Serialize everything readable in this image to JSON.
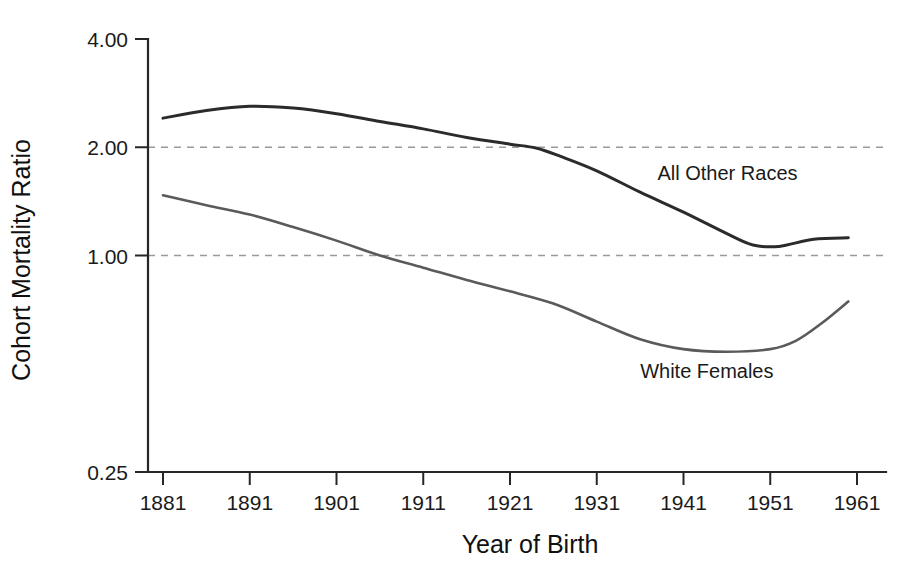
{
  "chart_data": {
    "type": "line",
    "title": "",
    "xlabel": "Year of Birth",
    "ylabel": "Cohort Mortality Ratio",
    "yscale": "log2",
    "ylim": [
      0.25,
      4.0
    ],
    "xlim": [
      1876,
      1962
    ],
    "grid": "horizontal-dashed-at-1-and-2",
    "legend_position": "inline-annotations",
    "ytick_labels": [
      "4.00",
      "2.00",
      "1.00",
      "0.25"
    ],
    "ytick_values": [
      4.0,
      2.0,
      1.0,
      0.25
    ],
    "gridline_values": [
      2.0,
      1.0
    ],
    "xtick_labels": [
      "1881",
      "1891",
      "1901",
      "1911",
      "1921",
      "1931",
      "1941",
      "1951",
      "1961"
    ],
    "xtick_values": [
      1881,
      1891,
      1901,
      1911,
      1921,
      1931,
      1941,
      1951,
      1961
    ],
    "series": [
      {
        "name": "All Other Races",
        "color": "#2b2b2b",
        "width": 3.0,
        "label_x": 1938,
        "label_y": 1.62,
        "x": [
          1881,
          1886,
          1891,
          1896,
          1901,
          1906,
          1911,
          1916,
          1921,
          1924,
          1927,
          1931,
          1936,
          1941,
          1946,
          1949,
          1952,
          1956,
          1960
        ],
        "values": [
          2.41,
          2.53,
          2.6,
          2.57,
          2.48,
          2.36,
          2.25,
          2.13,
          2.04,
          1.99,
          1.88,
          1.72,
          1.5,
          1.32,
          1.15,
          1.07,
          1.06,
          1.11,
          1.12
        ]
      },
      {
        "name": "White Females",
        "color": "#5a5a5a",
        "width": 2.6,
        "label_x": 1936,
        "label_y": 0.455,
        "x": [
          1881,
          1886,
          1891,
          1896,
          1901,
          1906,
          1911,
          1916,
          1921,
          1926,
          1931,
          1936,
          1941,
          1946,
          1951,
          1954,
          1957,
          1960
        ],
        "values": [
          1.47,
          1.38,
          1.3,
          1.2,
          1.1,
          1.0,
          0.925,
          0.855,
          0.795,
          0.735,
          0.655,
          0.585,
          0.549,
          0.54,
          0.549,
          0.58,
          0.65,
          0.745
        ]
      }
    ]
  },
  "axes": {
    "x_title": "Year of Birth",
    "y_title": "Cohort Mortality Ratio"
  }
}
